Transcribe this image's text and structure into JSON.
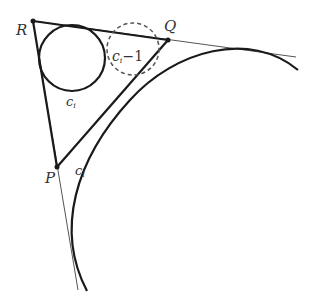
{
  "diagram": {
    "points": {
      "R": {
        "label": "R",
        "x": 33,
        "y": 21
      },
      "Q": {
        "label": "Q",
        "x": 168,
        "y": 40
      },
      "P": {
        "label": "P",
        "x": 57,
        "y": 167
      }
    },
    "circles": {
      "solid": {
        "label": "c",
        "subscript": "i",
        "cx": 72,
        "cy": 58,
        "r": 33
      },
      "dashed": {
        "label": "c",
        "subscript": "i",
        "suffix": "−1",
        "cx": 133,
        "cy": 49,
        "r": 26
      }
    },
    "arc_label": {
      "label": "c",
      "subscript": "i"
    },
    "colors": {
      "stroke": "#1a1a1a",
      "thin": "#555555",
      "text": "#333333"
    }
  }
}
